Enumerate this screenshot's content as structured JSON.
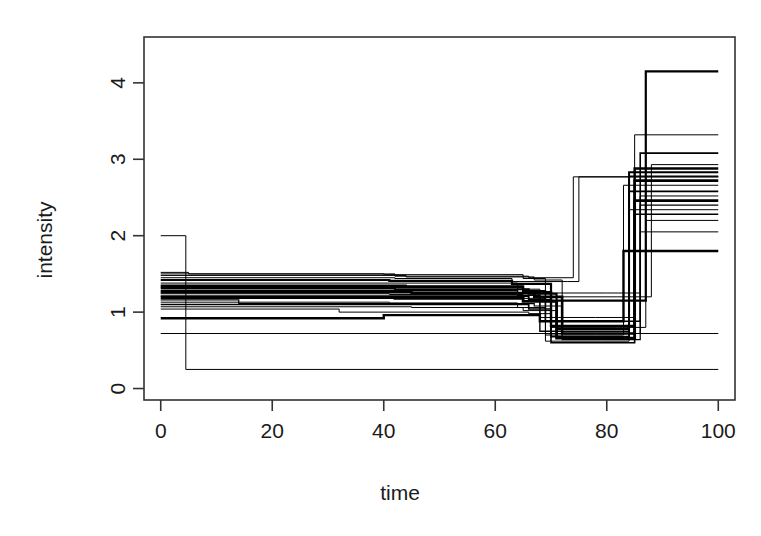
{
  "chart_data": {
    "type": "line",
    "subtype": "step-function-overlay",
    "title": "",
    "xlabel": "time",
    "ylabel": "intensity",
    "xlim": [
      -3,
      103
    ],
    "ylim": [
      -0.15,
      4.6
    ],
    "xticks": [
      0,
      20,
      40,
      60,
      80,
      100
    ],
    "xtick_labels": [
      "0",
      "20",
      "40",
      "60",
      "80",
      "100"
    ],
    "yticks": [
      0,
      1,
      2,
      3,
      4
    ],
    "ytick_labels": [
      "0",
      "1",
      "2",
      "3",
      "4"
    ],
    "grid": false,
    "legend": false,
    "box": "full-rectangle",
    "series_count": 22,
    "series": [
      {
        "name": "trace-01",
        "color": "#000000",
        "width": 1.0,
        "x": [
          0,
          4.5,
          100
        ],
        "y": [
          2.0,
          0.25,
          0.25
        ]
      },
      {
        "name": "trace-02",
        "color": "#000000",
        "width": 1.0,
        "x": [
          0,
          5,
          42,
          66,
          74,
          86,
          100
        ],
        "y": [
          1.52,
          1.5,
          1.47,
          1.45,
          2.77,
          2.77,
          2.77
        ]
      },
      {
        "name": "trace-03",
        "color": "#000000",
        "width": 2.2,
        "x": [
          0,
          41,
          63,
          70,
          81,
          87,
          100
        ],
        "y": [
          1.42,
          1.41,
          1.37,
          1.15,
          1.15,
          4.15,
          4.15
        ]
      },
      {
        "name": "trace-04",
        "color": "#000000",
        "width": 1.0,
        "x": [
          0,
          41,
          64,
          68,
          78,
          85,
          100
        ],
        "y": [
          1.38,
          1.38,
          1.3,
          0.93,
          0.93,
          3.32,
          3.32
        ]
      },
      {
        "name": "trace-05",
        "color": "#000000",
        "width": 1.6,
        "x": [
          0,
          44,
          65,
          69,
          80,
          86,
          100
        ],
        "y": [
          1.35,
          1.34,
          1.28,
          0.88,
          0.88,
          3.08,
          3.08
        ]
      },
      {
        "name": "trace-06",
        "color": "#000000",
        "width": 2.4,
        "x": [
          0,
          43,
          65,
          70,
          81,
          85,
          100
        ],
        "y": [
          1.33,
          1.33,
          1.26,
          0.82,
          0.82,
          2.88,
          2.88
        ]
      },
      {
        "name": "trace-07",
        "color": "#000000",
        "width": 2.0,
        "x": [
          0,
          42,
          66,
          71,
          80,
          84,
          100
        ],
        "y": [
          1.31,
          1.3,
          1.24,
          0.78,
          0.78,
          2.83,
          2.83
        ]
      },
      {
        "name": "trace-08",
        "color": "#000000",
        "width": 1.4,
        "x": [
          0,
          40,
          64,
          68,
          79,
          84,
          100
        ],
        "y": [
          1.28,
          1.28,
          1.22,
          0.75,
          0.75,
          2.78,
          2.78
        ]
      },
      {
        "name": "trace-09",
        "color": "#000000",
        "width": 2.6,
        "x": [
          0,
          45,
          67,
          72,
          81,
          85,
          100
        ],
        "y": [
          1.26,
          1.25,
          1.2,
          0.72,
          0.72,
          2.72,
          2.72
        ]
      },
      {
        "name": "trace-10",
        "color": "#000000",
        "width": 1.0,
        "x": [
          0,
          41,
          65,
          69,
          78,
          83,
          100
        ],
        "y": [
          1.24,
          1.23,
          1.18,
          0.7,
          0.7,
          2.66,
          2.66
        ]
      },
      {
        "name": "trace-11",
        "color": "#000000",
        "width": 1.8,
        "x": [
          0,
          43,
          66,
          70,
          80,
          84,
          100
        ],
        "y": [
          1.21,
          1.21,
          1.16,
          0.68,
          0.68,
          2.58,
          2.58
        ]
      },
      {
        "name": "trace-12",
        "color": "#000000",
        "width": 2.8,
        "x": [
          0,
          42,
          65,
          71,
          81,
          85,
          100
        ],
        "y": [
          1.19,
          1.18,
          1.14,
          0.66,
          0.66,
          2.46,
          2.46
        ]
      },
      {
        "name": "trace-13",
        "color": "#000000",
        "width": 1.2,
        "x": [
          0,
          14,
          44,
          67,
          72,
          82,
          86,
          100
        ],
        "y": [
          1.16,
          1.11,
          1.11,
          1.08,
          0.64,
          0.64,
          2.4,
          2.4
        ]
      },
      {
        "name": "trace-14",
        "color": "#000000",
        "width": 1.0,
        "x": [
          0,
          41,
          64,
          69,
          79,
          84,
          100
        ],
        "y": [
          1.13,
          1.12,
          1.06,
          0.62,
          0.62,
          2.34,
          2.34
        ]
      },
      {
        "name": "trace-15",
        "color": "#000000",
        "width": 1.6,
        "x": [
          0,
          43,
          66,
          70,
          80,
          85,
          100
        ],
        "y": [
          1.1,
          1.1,
          1.04,
          0.6,
          0.6,
          2.28,
          2.28
        ]
      },
      {
        "name": "trace-16",
        "color": "#000000",
        "width": 1.0,
        "x": [
          0,
          45,
          65,
          71,
          81,
          86,
          100
        ],
        "y": [
          1.07,
          1.06,
          1.02,
          0.72,
          0.72,
          2.05,
          2.05
        ]
      },
      {
        "name": "trace-17",
        "color": "#000000",
        "width": 2.4,
        "x": [
          0,
          30,
          40,
          64,
          68,
          79,
          83,
          100
        ],
        "y": [
          0.92,
          0.92,
          0.96,
          0.96,
          0.88,
          0.88,
          1.8,
          1.8
        ]
      },
      {
        "name": "trace-18",
        "color": "#000000",
        "width": 1.0,
        "x": [
          0,
          4.5,
          100
        ],
        "y": [
          0.72,
          0.72,
          0.72
        ]
      },
      {
        "name": "trace-19",
        "color": "#000000",
        "width": 1.0,
        "x": [
          0,
          42,
          63,
          73,
          75,
          84,
          100
        ],
        "y": [
          1.45,
          1.44,
          1.4,
          1.4,
          2.77,
          2.77,
          2.77
        ]
      },
      {
        "name": "trace-20",
        "color": "#000000",
        "width": 1.0,
        "x": [
          0,
          32,
          42,
          66,
          70,
          82,
          87,
          100
        ],
        "y": [
          1.04,
          1.0,
          1.0,
          0.98,
          0.8,
          0.8,
          2.2,
          2.2
        ]
      },
      {
        "name": "trace-21",
        "color": "#000000",
        "width": 1.0,
        "x": [
          0,
          44,
          67,
          72,
          82,
          88,
          100
        ],
        "y": [
          1.48,
          1.46,
          1.42,
          1.2,
          1.2,
          2.93,
          2.93
        ]
      },
      {
        "name": "trace-22",
        "color": "#000000",
        "width": 1.0,
        "x": [
          0,
          40,
          65,
          69,
          80,
          86,
          100
        ],
        "y": [
          1.5,
          1.49,
          1.44,
          1.25,
          1.25,
          2.52,
          2.52
        ]
      }
    ]
  },
  "axes": {
    "x_title": "time",
    "y_title": "intensity",
    "x_tick_labels": [
      "0",
      "20",
      "40",
      "60",
      "80",
      "100"
    ],
    "y_tick_labels": [
      "0",
      "1",
      "2",
      "3",
      "4"
    ]
  },
  "style": {
    "background": "#ffffff",
    "foreground": "#1a1a1a",
    "axis_color": "#333333",
    "trace_color": "#000000"
  }
}
